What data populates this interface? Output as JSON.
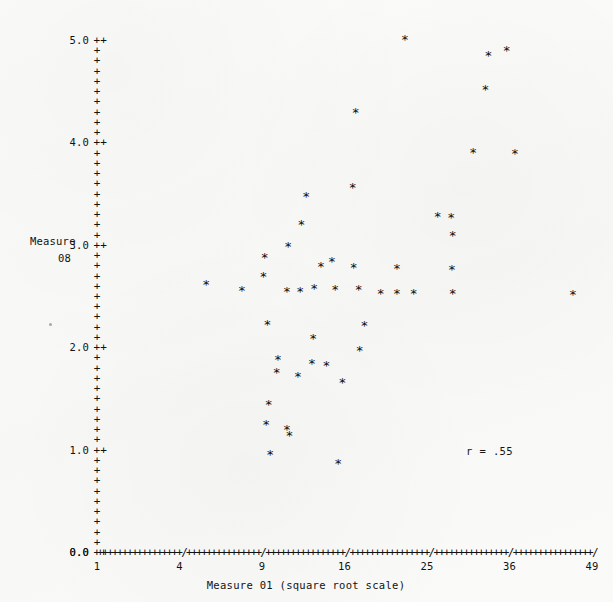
{
  "plot": {
    "background_color": "#fbfbfa",
    "ink_color": "#111111",
    "marker_glyph": "*",
    "tick_glyph": "+",
    "major_tick_glyph": "++",
    "axis_break_glyph": "/"
  },
  "axes": {
    "y": {
      "title_line1": "Measure",
      "title_line2": "08",
      "major_labels": [
        "5.0",
        "4.0",
        "3.0",
        "2.0",
        "1.0",
        "0.0"
      ],
      "major_values": [
        5.0,
        4.0,
        3.0,
        2.0,
        1.0,
        0.0
      ],
      "minor_tick_step": 0.1,
      "min": 0.0,
      "max": 5.0,
      "tick_count": 51
    },
    "x": {
      "title": "Measure 01 (square root scale)",
      "tick_labels": [
        "1",
        "4",
        "9",
        "16",
        "25",
        "36",
        "49"
      ],
      "tick_values": [
        1,
        4,
        9,
        16,
        25,
        36,
        49
      ],
      "scale": "square root",
      "min": 1,
      "max": 49
    }
  },
  "annotations": {
    "correlation": "r = .55"
  },
  "chart_data": {
    "type": "scatter",
    "title": "",
    "subtitle": "",
    "xlabel": "Measure 01 (square root scale)",
    "ylabel": "Measure 08",
    "xscale": "sqrt",
    "yscale": "linear",
    "xlim": [
      1,
      49
    ],
    "ylim": [
      0.0,
      5.0
    ],
    "xticks": [
      1,
      4,
      9,
      16,
      25,
      36,
      49
    ],
    "yticks": [
      0.0,
      1.0,
      2.0,
      3.0,
      4.0,
      5.0
    ],
    "grid": false,
    "legend": "none",
    "marker": "*",
    "annotations": [
      {
        "text": "r = .55",
        "x": 30.0,
        "y": 1.05
      }
    ],
    "series": [
      {
        "name": "observations",
        "marker": "*",
        "color": "#0d0d0d",
        "points": [
          {
            "x": 22.4,
            "y": 5.01
          },
          {
            "x": 33.0,
            "y": 4.85
          },
          {
            "x": 35.6,
            "y": 4.9
          },
          {
            "x": 32.6,
            "y": 4.52
          },
          {
            "x": 17.1,
            "y": 4.3
          },
          {
            "x": 30.9,
            "y": 3.91
          },
          {
            "x": 36.8,
            "y": 3.9
          },
          {
            "x": 16.8,
            "y": 3.56
          },
          {
            "x": 12.5,
            "y": 3.48
          },
          {
            "x": 26.3,
            "y": 3.28
          },
          {
            "x": 28.0,
            "y": 3.27
          },
          {
            "x": 12.1,
            "y": 3.2
          },
          {
            "x": 28.2,
            "y": 3.1
          },
          {
            "x": 11.0,
            "y": 2.99
          },
          {
            "x": 9.2,
            "y": 2.88
          },
          {
            "x": 14.8,
            "y": 2.84
          },
          {
            "x": 13.8,
            "y": 2.79
          },
          {
            "x": 16.9,
            "y": 2.78
          },
          {
            "x": 21.5,
            "y": 2.77
          },
          {
            "x": 28.1,
            "y": 2.76
          },
          {
            "x": 9.1,
            "y": 2.7
          },
          {
            "x": 5.4,
            "y": 2.62
          },
          {
            "x": 13.2,
            "y": 2.58
          },
          {
            "x": 15.1,
            "y": 2.57
          },
          {
            "x": 17.4,
            "y": 2.57
          },
          {
            "x": 7.6,
            "y": 2.56
          },
          {
            "x": 10.9,
            "y": 2.55
          },
          {
            "x": 12.0,
            "y": 2.55
          },
          {
            "x": 19.7,
            "y": 2.53
          },
          {
            "x": 21.5,
            "y": 2.53
          },
          {
            "x": 23.4,
            "y": 2.53
          },
          {
            "x": 28.2,
            "y": 2.53
          },
          {
            "x": 45.8,
            "y": 2.52
          },
          {
            "x": 9.4,
            "y": 2.23
          },
          {
            "x": 18.0,
            "y": 2.22
          },
          {
            "x": 13.1,
            "y": 2.09
          },
          {
            "x": 17.5,
            "y": 1.97
          },
          {
            "x": 10.2,
            "y": 1.88
          },
          {
            "x": 13.0,
            "y": 1.85
          },
          {
            "x": 14.3,
            "y": 1.83
          },
          {
            "x": 10.1,
            "y": 1.76
          },
          {
            "x": 11.8,
            "y": 1.72
          },
          {
            "x": 15.8,
            "y": 1.66
          },
          {
            "x": 9.5,
            "y": 1.45
          },
          {
            "x": 9.3,
            "y": 1.25
          },
          {
            "x": 10.9,
            "y": 1.2
          },
          {
            "x": 11.1,
            "y": 1.14
          },
          {
            "x": 9.6,
            "y": 0.96
          },
          {
            "x": 15.4,
            "y": 0.87
          }
        ]
      }
    ]
  }
}
